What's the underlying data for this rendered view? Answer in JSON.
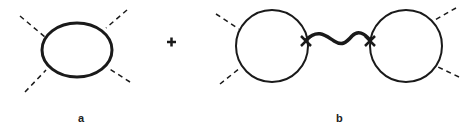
{
  "diagram": {
    "type": "feynman-diagrams",
    "operator": "+",
    "panels": [
      {
        "label": "a",
        "description": "single loop with four dashed external legs"
      },
      {
        "label": "b",
        "description": "two loops joined by a wavy propagator between cross vertices, each loop with two dashed external legs"
      }
    ]
  },
  "colors": {
    "line": "#1a1a1a",
    "background": "#ffffff"
  }
}
